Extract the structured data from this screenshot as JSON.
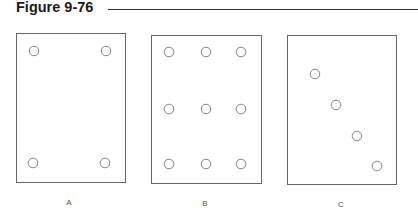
{
  "figure": {
    "title": "Figure 9-76",
    "panels": [
      {
        "label": "A",
        "box": {
          "x": 16,
          "y": 33,
          "w": 109,
          "h": 149
        },
        "holes": [
          [
            34,
            51
          ],
          [
            106,
            51
          ],
          [
            33,
            163
          ],
          [
            105,
            163
          ]
        ]
      },
      {
        "label": "B",
        "box": {
          "x": 151,
          "y": 35,
          "w": 110,
          "h": 148
        },
        "holes": [
          [
            169,
            52
          ],
          [
            206,
            52
          ],
          [
            241,
            52
          ],
          [
            169,
            109
          ],
          [
            206,
            109
          ],
          [
            241,
            109
          ],
          [
            169,
            164
          ],
          [
            206,
            164
          ],
          [
            241,
            164
          ]
        ]
      },
      {
        "label": "C",
        "box": {
          "x": 287,
          "y": 35,
          "w": 109,
          "h": 149
        },
        "holes": [
          [
            315,
            74
          ],
          [
            336,
            105
          ],
          [
            357,
            136
          ],
          [
            377,
            166
          ]
        ]
      }
    ],
    "colors": {
      "box_stroke": "#666666",
      "hole_stroke": "#777777",
      "title": "#1a1a1a"
    }
  }
}
